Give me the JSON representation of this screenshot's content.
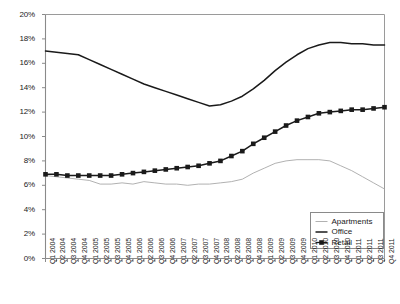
{
  "chart_data": {
    "type": "line",
    "title": "",
    "xlabel": "",
    "ylabel": "",
    "ylim": [
      0,
      20
    ],
    "yunit": "%",
    "ytick_labels": [
      "0%",
      "2%",
      "4%",
      "6%",
      "8%",
      "10%",
      "12%",
      "14%",
      "16%",
      "18%",
      "20%"
    ],
    "ytick_values": [
      0,
      2,
      4,
      6,
      8,
      10,
      12,
      14,
      16,
      18,
      20
    ],
    "grid": false,
    "legend_position": "bottom-right",
    "categories": [
      "Q1 2004",
      "Q2 2004",
      "Q3 2004",
      "Q4 2004",
      "Q1 2005",
      "Q2 2005",
      "Q3 2005",
      "Q4 2005",
      "Q1 2006",
      "Q2 2006",
      "Q3 2006",
      "Q4 2006",
      "Q1 2007",
      "Q2 2007",
      "Q3 2007",
      "Q4 2007",
      "Q1 2008",
      "Q2 2008",
      "Q3 2008",
      "Q4 2008",
      "Q1 2009",
      "Q2 2009",
      "Q3 2009",
      "Q4 2009",
      "Q1 2010",
      "Q2 2010",
      "Q3 2010",
      "Q4 2010",
      "Q1 2011",
      "Q2 2011",
      "Q3 2011",
      "Q4 2011"
    ],
    "series": [
      {
        "name": "Apartments",
        "color": "#a8a8a8",
        "marker": "none",
        "values": [
          6.8,
          6.7,
          6.6,
          6.5,
          6.4,
          6.1,
          6.1,
          6.2,
          6.1,
          6.3,
          6.2,
          6.1,
          6.1,
          6.0,
          6.1,
          6.1,
          6.2,
          6.3,
          6.5,
          7.0,
          7.4,
          7.8,
          8.0,
          8.1,
          8.1,
          8.1,
          8.0,
          7.6,
          7.2,
          6.7,
          6.2,
          5.7
        ]
      },
      {
        "name": "Office",
        "color": "#1a1a1a",
        "marker": "none",
        "values": [
          17.0,
          16.9,
          16.8,
          16.7,
          16.3,
          15.9,
          15.5,
          15.1,
          14.7,
          14.3,
          14.0,
          13.7,
          13.4,
          13.1,
          12.8,
          12.5,
          12.6,
          12.9,
          13.3,
          13.9,
          14.6,
          15.4,
          16.1,
          16.7,
          17.2,
          17.5,
          17.7,
          17.7,
          17.6,
          17.6,
          17.5,
          17.5
        ]
      },
      {
        "name": "Retail",
        "color": "#1a1a1a",
        "marker": "square",
        "values": [
          6.9,
          6.9,
          6.8,
          6.8,
          6.8,
          6.8,
          6.8,
          6.9,
          7.0,
          7.1,
          7.2,
          7.3,
          7.4,
          7.5,
          7.6,
          7.8,
          8.0,
          8.4,
          8.8,
          9.4,
          9.9,
          10.4,
          10.9,
          11.3,
          11.6,
          11.9,
          12.0,
          12.1,
          12.2,
          12.2,
          12.3,
          12.4
        ]
      }
    ]
  },
  "legend": {
    "items": [
      {
        "label": "Apartments"
      },
      {
        "label": "Office"
      },
      {
        "label": "Retail"
      }
    ]
  }
}
